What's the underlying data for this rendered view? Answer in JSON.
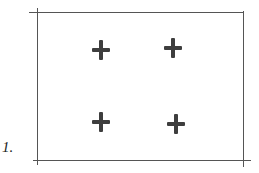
{
  "figure": {
    "label": "1.",
    "frame": {
      "left": 37,
      "top": 13,
      "right": 243,
      "bottom": 160,
      "stroke": "#555555"
    },
    "marks": [
      {
        "type": "cross",
        "x": 101,
        "y": 50
      },
      {
        "type": "cross",
        "x": 173,
        "y": 48
      },
      {
        "type": "cross",
        "x": 101,
        "y": 122
      },
      {
        "type": "cross",
        "x": 176,
        "y": 124
      }
    ],
    "mark_color": "#3e3e3e"
  }
}
